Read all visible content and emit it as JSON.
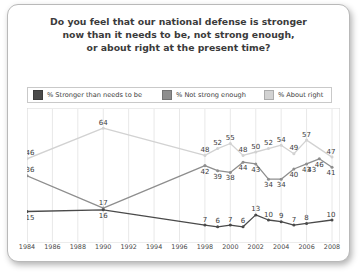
{
  "card": {
    "title_lines": [
      "Do you feel that our national defense is stronger",
      "now than it needs to be, not strong enough,",
      "or about right at the present time?"
    ]
  },
  "legend": {
    "items": [
      {
        "label": "% Stronger than needs to be",
        "color": "#4a4a4a",
        "swatch_name": "legend-swatch-stronger"
      },
      {
        "label": "% Not strong enough",
        "color": "#8e8e8e",
        "swatch_name": "legend-swatch-not-strong"
      },
      {
        "label": "% About right",
        "color": "#d2d2d2",
        "swatch_name": "legend-swatch-about-right"
      }
    ]
  },
  "chart_data": {
    "type": "line",
    "title": "Do you feel that our national defense is stronger now than it needs to be, not strong enough, or about right at the present time?",
    "xlabel": "",
    "ylabel": "",
    "xlim": [
      1984,
      2008
    ],
    "ylim": [
      0,
      70
    ],
    "grid": "vertical",
    "legend_position": "top",
    "x_ticks": [
      1984,
      1986,
      1988,
      1990,
      1992,
      1994,
      1996,
      1998,
      2000,
      2002,
      2004,
      2006,
      2008
    ],
    "series": [
      {
        "name": "% Stronger than needs to be",
        "color": "#4a4a4a",
        "points": [
          {
            "x": 1984,
            "y": 15,
            "label": "15"
          },
          {
            "x": 1990,
            "y": 16,
            "label": "16"
          },
          {
            "x": 1998,
            "y": 7,
            "label": "7"
          },
          {
            "x": 1999,
            "y": 6,
            "label": "6"
          },
          {
            "x": 2000,
            "y": 7,
            "label": "7"
          },
          {
            "x": 2001,
            "y": 6,
            "label": "6"
          },
          {
            "x": 2002,
            "y": 13,
            "label": "13"
          },
          {
            "x": 2003,
            "y": 10,
            "label": "10"
          },
          {
            "x": 2004,
            "y": 9,
            "label": "9"
          },
          {
            "x": 2005,
            "y": 7,
            "label": "7"
          },
          {
            "x": 2006,
            "y": 8,
            "label": "8"
          },
          {
            "x": 2008,
            "y": 10,
            "label": "10"
          }
        ]
      },
      {
        "name": "% Not strong enough",
        "color": "#8e8e8e",
        "points": [
          {
            "x": 1984,
            "y": 36,
            "label": "36"
          },
          {
            "x": 1990,
            "y": 17,
            "label": "17"
          },
          {
            "x": 1998,
            "y": 42,
            "label": "42"
          },
          {
            "x": 1999,
            "y": 39,
            "label": "39"
          },
          {
            "x": 2000,
            "y": 38,
            "label": "38"
          },
          {
            "x": 2001,
            "y": 44,
            "label": "44"
          },
          {
            "x": 2002,
            "y": 43,
            "label": "43"
          },
          {
            "x": 2003,
            "y": 34,
            "label": "34"
          },
          {
            "x": 2004,
            "y": 34,
            "label": "34"
          },
          {
            "x": 2005,
            "y": 40,
            "label": "40"
          },
          {
            "x": 2006,
            "y": 43,
            "label": "43"
          },
          {
            "x": 2007,
            "y": 46,
            "label": "46"
          },
          {
            "x": 2008,
            "y": 41,
            "label": "41"
          }
        ],
        "extra_labels": [
          {
            "x": 2006.4,
            "y": 43,
            "label": "43"
          }
        ]
      },
      {
        "name": "% About right",
        "color": "#d2d2d2",
        "points": [
          {
            "x": 1984,
            "y": 46,
            "label": "46"
          },
          {
            "x": 1990,
            "y": 64,
            "label": "64"
          },
          {
            "x": 1998,
            "y": 48,
            "label": "48"
          },
          {
            "x": 1999,
            "y": 52,
            "label": "52"
          },
          {
            "x": 2000,
            "y": 55,
            "label": "55"
          },
          {
            "x": 2001,
            "y": 48,
            "label": "48"
          },
          {
            "x": 2002,
            "y": 50,
            "label": "50"
          },
          {
            "x": 2003,
            "y": 52,
            "label": "52"
          },
          {
            "x": 2004,
            "y": 54,
            "label": "54"
          },
          {
            "x": 2005,
            "y": 49,
            "label": "49"
          },
          {
            "x": 2006,
            "y": 57,
            "label": "57"
          },
          {
            "x": 2008,
            "y": 47,
            "label": "47"
          }
        ]
      }
    ]
  }
}
